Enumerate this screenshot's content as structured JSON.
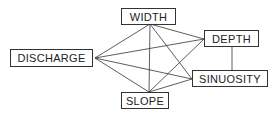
{
  "diagram": {
    "type": "network",
    "nodes": [
      {
        "id": "width",
        "label": "WIDTH",
        "x": 121,
        "y": 8,
        "w": 55,
        "h": 17,
        "ax": 150,
        "ay": 24
      },
      {
        "id": "discharge",
        "label": "DISCHARGE",
        "x": 10,
        "y": 49,
        "w": 83,
        "h": 18,
        "ax": 95,
        "ay": 58
      },
      {
        "id": "depth",
        "label": "DEPTH",
        "x": 204,
        "y": 30,
        "w": 55,
        "h": 17,
        "ax": 204,
        "ay": 39
      },
      {
        "id": "sinuosity",
        "label": "SINUOSITY",
        "x": 192,
        "y": 70,
        "w": 76,
        "h": 17,
        "ax": 192,
        "ay": 79
      },
      {
        "id": "slope",
        "label": "SLOPE",
        "x": 121,
        "y": 92,
        "w": 48,
        "h": 17,
        "ax": 149,
        "ay": 92
      }
    ],
    "edges": [
      {
        "from": "width",
        "to": "discharge"
      },
      {
        "from": "width",
        "to": "depth"
      },
      {
        "from": "width",
        "to": "sinuosity"
      },
      {
        "from": "width",
        "to": "slope"
      },
      {
        "from": "discharge",
        "to": "depth"
      },
      {
        "from": "discharge",
        "to": "sinuosity"
      },
      {
        "from": "discharge",
        "to": "slope"
      },
      {
        "from": "depth",
        "to": "slope"
      },
      {
        "from": "depth",
        "to": "sinuosity"
      },
      {
        "from": "slope",
        "to": "sinuosity"
      }
    ],
    "colors": {
      "line": "#333333",
      "box_border": "#333333",
      "text": "#222222"
    }
  }
}
